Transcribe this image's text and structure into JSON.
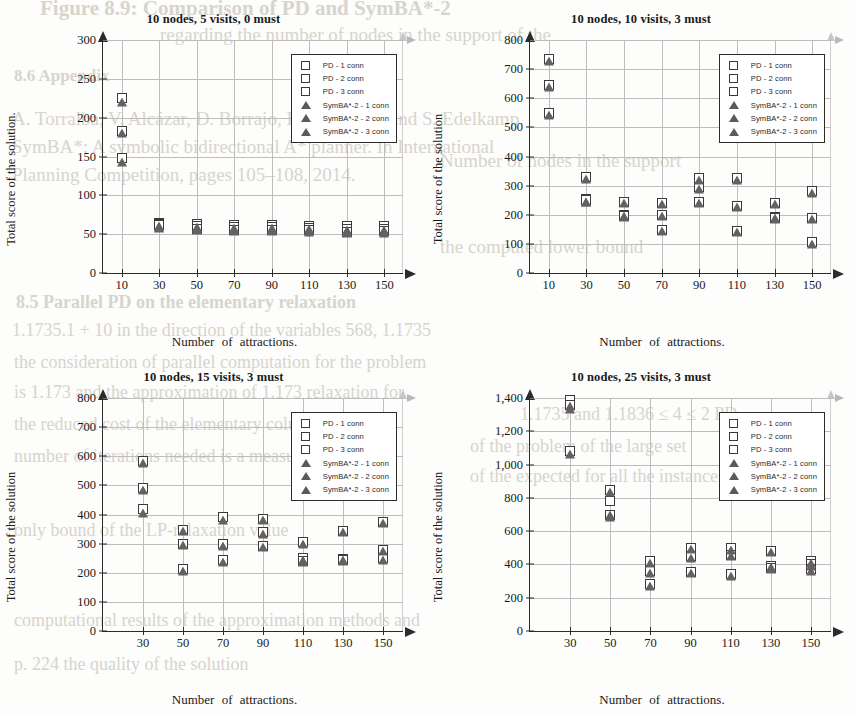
{
  "page": {
    "background_color": "#fdfdfb",
    "ghost_text": [
      {
        "text": "Figure 8.9: Comparison of PD and SymBA*-2",
        "x": 40,
        "y": -4,
        "size": 21,
        "weight": "bold"
      },
      {
        "text": "regarding the number of nodes in the support of the",
        "x": 160,
        "y": 24,
        "size": 19,
        "weight": "normal"
      },
      {
        "text": "8.6  Appendix",
        "x": 14,
        "y": 66,
        "size": 17,
        "weight": "bold"
      },
      {
        "text": "A. Torralba, V. Alcázar, D. Borrajo, P. Kissmann, and S. Edelkamp.",
        "x": 12,
        "y": 108,
        "size": 19,
        "weight": "normal"
      },
      {
        "text": "SymBA*: A symbolic bidirectional A* planner. In International",
        "x": 12,
        "y": 136,
        "size": 19,
        "weight": "normal"
      },
      {
        "text": "Planning Competition, pages 105–108, 2014.",
        "x": 12,
        "y": 164,
        "size": 19,
        "weight": "normal"
      },
      {
        "text": "8.5   Parallel PD on the elementary relaxation",
        "x": 16,
        "y": 292,
        "size": 18,
        "weight": "bold"
      },
      {
        "text": "1.1735.1 + 10 in the direction of the variables 568, 1.1735",
        "x": 12,
        "y": 320,
        "size": 18,
        "weight": "normal"
      },
      {
        "text": "the consideration of parallel computation for the problem",
        "x": 14,
        "y": 352,
        "size": 18,
        "weight": "normal"
      },
      {
        "text": "is 1.173 and the approximation of 1.173 relaxation for",
        "x": 14,
        "y": 382,
        "size": 18,
        "weight": "normal"
      },
      {
        "text": "the reduced cost of the elementary columns, and the",
        "x": 14,
        "y": 414,
        "size": 18,
        "weight": "normal"
      },
      {
        "text": "number of iterations needed is a measure of quality",
        "x": 14,
        "y": 446,
        "size": 18,
        "weight": "normal"
      },
      {
        "text": "only bound of the LP-relaxation value",
        "x": 14,
        "y": 520,
        "size": 18,
        "weight": "normal"
      },
      {
        "text": "computational results of the approximation methods and",
        "x": 14,
        "y": 610,
        "size": 18,
        "weight": "normal"
      },
      {
        "text": "p. 224 the quality of the solution",
        "x": 14,
        "y": 654,
        "size": 18,
        "weight": "normal"
      },
      {
        "text": "Number of nodes in the support",
        "x": 440,
        "y": 150,
        "size": 19,
        "weight": "normal"
      },
      {
        "text": "the computed lower bound",
        "x": 440,
        "y": 236,
        "size": 19,
        "weight": "normal"
      },
      {
        "text": "1.1735 and 1.1836 ≤ 4 ≤ 2 PD",
        "x": 520,
        "y": 404,
        "size": 18,
        "weight": "normal"
      },
      {
        "text": "of the problem of the large set",
        "x": 470,
        "y": 436,
        "size": 18,
        "weight": "normal"
      },
      {
        "text": "of the expected for all the instances",
        "x": 470,
        "y": 466,
        "size": 18,
        "weight": "normal"
      }
    ]
  },
  "legend": {
    "entries": [
      {
        "symbol": "square",
        "label": "PD - 1 conn"
      },
      {
        "symbol": "square",
        "label": "PD - 2 conn"
      },
      {
        "symbol": "square",
        "label": "PD - 3 conn"
      },
      {
        "symbol": "triangle",
        "label": "SymBA*-2 - 1 conn"
      },
      {
        "symbol": "triangle",
        "label": "SymBA*-2 - 2 conn"
      },
      {
        "symbol": "triangle",
        "label": "SymBA*-2 - 3 conn"
      }
    ]
  },
  "colors": {
    "square_fill": "#ffffff",
    "square_stroke": "#3a3a3a",
    "triangle_fill": "#666060",
    "axis": "#2b2b2b",
    "grid": "#bdbdbd"
  },
  "chart_data": [
    {
      "id": "top-left",
      "type": "scatter",
      "title": "10 nodes, 5 visits, 0 must",
      "xlabel": "Number  of  attractions.",
      "ylabel": "Total score of the solution.",
      "xticks": [
        10,
        30,
        50,
        70,
        90,
        110,
        130,
        150
      ],
      "yticks": [
        0,
        50,
        100,
        150,
        200,
        250,
        300
      ],
      "xlim": [
        0,
        160
      ],
      "ylim": [
        0,
        300
      ],
      "grid": true,
      "legend_position": "top-right",
      "x": [
        10,
        30,
        50,
        70,
        90,
        110,
        130,
        150
      ],
      "series": [
        {
          "name": "PD - 1 conn",
          "symbol": "square",
          "values": [
            225,
            64,
            63,
            62,
            62,
            61,
            60,
            60
          ]
        },
        {
          "name": "PD - 2 conn",
          "symbol": "square",
          "values": [
            183,
            63,
            60,
            59,
            59,
            58,
            57,
            57
          ]
        },
        {
          "name": "PD - 3 conn",
          "symbol": "square",
          "values": [
            148,
            62,
            57,
            56,
            56,
            55,
            53,
            54
          ]
        },
        {
          "name": "SymBA*-2 - 1 conn",
          "symbol": "triangle",
          "values": [
            220,
            60,
            59,
            58,
            58,
            57,
            56,
            56
          ]
        },
        {
          "name": "SymBA*-2 - 2 conn",
          "symbol": "triangle",
          "values": [
            180,
            59,
            57,
            56,
            56,
            55,
            54,
            54
          ]
        },
        {
          "name": "SymBA*-2 - 3 conn",
          "symbol": "triangle",
          "values": [
            143,
            58,
            55,
            54,
            54,
            53,
            51,
            52
          ]
        }
      ]
    },
    {
      "id": "top-right",
      "type": "scatter",
      "title": "10 nodes, 10 visits, 3 must",
      "xlabel": "Number  of  attractions.",
      "ylabel": "Total score of the solution",
      "xticks": [
        10,
        30,
        50,
        70,
        90,
        110,
        130,
        150
      ],
      "yticks": [
        0,
        100,
        200,
        300,
        400,
        500,
        600,
        700,
        800
      ],
      "xlim": [
        0,
        160
      ],
      "ylim": [
        0,
        800
      ],
      "grid": true,
      "legend_position": "top-right",
      "x": [
        10,
        30,
        50,
        70,
        90,
        110,
        130,
        150
      ],
      "series": [
        {
          "name": "PD - 1 conn",
          "symbol": "square",
          "values": [
            735,
            330,
            243,
            240,
            325,
            325,
            240,
            280
          ]
        },
        {
          "name": "PD - 2 conn",
          "symbol": "square",
          "values": [
            645,
            255,
            200,
            200,
            295,
            230,
            192,
            190
          ]
        },
        {
          "name": "PD - 3 conn",
          "symbol": "square",
          "values": [
            550,
            250,
            195,
            148,
            243,
            143,
            188,
            105
          ]
        },
        {
          "name": "SymBA*-2 - 1 conn",
          "symbol": "triangle",
          "values": [
            728,
            323,
            240,
            238,
            320,
            320,
            237,
            275
          ]
        },
        {
          "name": "SymBA*-2 - 2 conn",
          "symbol": "triangle",
          "values": [
            638,
            245,
            197,
            196,
            290,
            227,
            188,
            187
          ]
        },
        {
          "name": "SymBA*-2 - 3 conn",
          "symbol": "triangle",
          "values": [
            543,
            243,
            192,
            144,
            240,
            140,
            185,
            100
          ]
        }
      ]
    },
    {
      "id": "bottom-left",
      "type": "scatter",
      "title": "10 nodes, 15 visits, 3 must",
      "xlabel": "Number  of  attractions.",
      "ylabel": "Total score of the solution",
      "xticks": [
        30,
        50,
        70,
        90,
        110,
        130,
        150
      ],
      "yticks": [
        0,
        100,
        200,
        300,
        400,
        500,
        600,
        700,
        800
      ],
      "xlim": [
        10,
        160
      ],
      "ylim": [
        0,
        800
      ],
      "grid": true,
      "legend_position": "top-right",
      "x": [
        30,
        50,
        70,
        90,
        110,
        130,
        150
      ],
      "series": [
        {
          "name": "PD - 1 conn",
          "symbol": "square",
          "values": [
            583,
            348,
            392,
            385,
            305,
            343,
            375
          ]
        },
        {
          "name": "PD - 2 conn",
          "symbol": "square",
          "values": [
            490,
            300,
            297,
            340,
            250,
            248,
            278
          ]
        },
        {
          "name": "PD - 3 conn",
          "symbol": "square",
          "values": [
            420,
            212,
            243,
            292,
            240,
            245,
            250
          ]
        },
        {
          "name": "SymBA*-2 - 1 conn",
          "symbol": "triangle",
          "values": [
            578,
            343,
            380,
            380,
            298,
            340,
            370
          ]
        },
        {
          "name": "SymBA*-2 - 2 conn",
          "symbol": "triangle",
          "values": [
            485,
            295,
            293,
            333,
            245,
            245,
            273
          ]
        },
        {
          "name": "SymBA*-2 - 3 conn",
          "symbol": "triangle",
          "values": [
            405,
            207,
            238,
            288,
            236,
            242,
            245
          ]
        }
      ]
    },
    {
      "id": "bottom-right",
      "type": "scatter",
      "title": "10 nodes, 25 visits, 3 must",
      "xlabel": "Number  of  attractions.",
      "ylabel": "Total score of the solution",
      "xticks": [
        30,
        50,
        70,
        90,
        110,
        130,
        150
      ],
      "yticks": [
        0,
        200,
        400,
        600,
        800,
        "1,000",
        "1,200",
        "1,400"
      ],
      "ytick_values": [
        0,
        200,
        400,
        600,
        800,
        1000,
        1200,
        1400
      ],
      "xlim": [
        10,
        160
      ],
      "ylim": [
        0,
        1400
      ],
      "grid": true,
      "legend_position": "top-right",
      "x": [
        30,
        50,
        70,
        90,
        110,
        130,
        150
      ],
      "series": [
        {
          "name": "PD - 1 conn",
          "symbol": "square",
          "values": [
            1385,
            845,
            420,
            498,
            500,
            480,
            418
          ]
        },
        {
          "name": "PD - 2 conn",
          "symbol": "square",
          "values": [
            1360,
            780,
            360,
            450,
            455,
            390,
            400
          ]
        },
        {
          "name": "PD - 3 conn",
          "symbol": "square",
          "values": [
            1080,
            695,
            280,
            355,
            340,
            380,
            370
          ]
        },
        {
          "name": "SymBA*-2 - 1 conn",
          "symbol": "triangle",
          "values": [
            1350,
            838,
            408,
            490,
            485,
            472,
            410
          ]
        },
        {
          "name": "SymBA*-2 - 2 conn",
          "symbol": "triangle",
          "values": [
            1335,
            700,
            350,
            440,
            448,
            383,
            390
          ]
        },
        {
          "name": "SymBA*-2 - 3 conn",
          "symbol": "triangle",
          "values": [
            1062,
            685,
            270,
            348,
            333,
            375,
            360
          ]
        }
      ]
    }
  ]
}
